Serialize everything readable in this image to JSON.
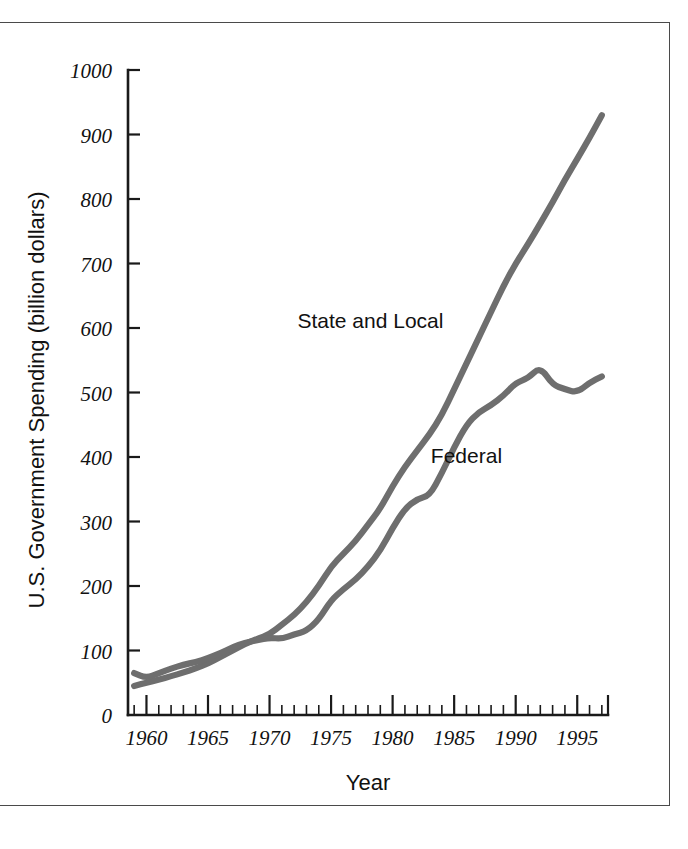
{
  "chart_data": {
    "type": "line",
    "title": "",
    "xlabel": "Year",
    "ylabel": "U.S. Government Spending (billion dollars)",
    "xlim": [
      1958.5,
      1997.5
    ],
    "ylim": [
      0,
      1000
    ],
    "grid": false,
    "legend_position": "inline-annotations",
    "x_ticks_major": [
      "1960",
      "1965",
      "1970",
      "1975",
      "1980",
      "1985",
      "1990",
      "1995"
    ],
    "x_ticks_major_values": [
      1960,
      1965,
      1970,
      1975,
      1980,
      1985,
      1990,
      1995
    ],
    "x_minor_tick_step": 1,
    "y_ticks": [
      "0",
      "100",
      "200",
      "300",
      "400",
      "500",
      "600",
      "700",
      "800",
      "900",
      "1000"
    ],
    "y_tick_values": [
      0,
      100,
      200,
      300,
      400,
      500,
      600,
      700,
      800,
      900,
      1000
    ],
    "x": [
      1959,
      1960,
      1961,
      1962,
      1963,
      1964,
      1965,
      1966,
      1967,
      1968,
      1969,
      1970,
      1971,
      1972,
      1973,
      1974,
      1975,
      1976,
      1977,
      1978,
      1979,
      1980,
      1981,
      1982,
      1983,
      1984,
      1985,
      1986,
      1987,
      1988,
      1989,
      1990,
      1991,
      1992,
      1993,
      1994,
      1995,
      1996,
      1997
    ],
    "series": [
      {
        "name": "State and Local",
        "label": "State and Local",
        "color": "#6e6e6e",
        "label_x": 1978.2,
        "label_y": 600,
        "values": [
          45,
          50,
          55,
          60,
          66,
          72,
          80,
          90,
          100,
          110,
          118,
          125,
          140,
          155,
          175,
          200,
          230,
          250,
          270,
          295,
          320,
          355,
          385,
          410,
          435,
          465,
          505,
          545,
          585,
          625,
          665,
          700,
          730,
          762,
          795,
          830,
          862,
          895,
          930
        ]
      },
      {
        "name": "Federal",
        "label": "Federal",
        "color": "#6e6e6e",
        "label_x": 1986.0,
        "label_y": 390,
        "values": [
          65,
          57,
          65,
          72,
          78,
          82,
          88,
          96,
          105,
          112,
          116,
          120,
          118,
          125,
          130,
          148,
          178,
          195,
          210,
          230,
          255,
          290,
          320,
          335,
          340,
          375,
          415,
          450,
          470,
          480,
          495,
          515,
          522,
          540,
          512,
          505,
          500,
          515,
          525
        ]
      }
    ]
  }
}
